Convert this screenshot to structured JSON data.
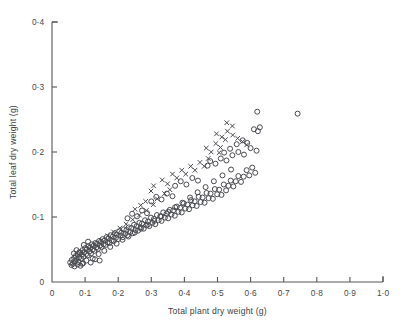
{
  "chart_data": {
    "type": "scatter",
    "title": "",
    "xlabel": "Total plant dry weight (g)",
    "ylabel": "Total leaf dry weight (g)",
    "xlim": [
      0,
      1.0
    ],
    "ylim": [
      0,
      0.4
    ],
    "grid": false,
    "legend": "none",
    "xticks": [
      0,
      0.1,
      0.2,
      0.3,
      0.4,
      0.5,
      0.6,
      0.7,
      0.8,
      0.9,
      1.0
    ],
    "xticklabels": [
      "0",
      "0·1",
      "0·2",
      "0·3",
      "0·4",
      "0·5",
      "0·6",
      "0·7",
      "0·8",
      "0·9",
      "1·0"
    ],
    "yticks": [
      0,
      0.1,
      0.2,
      0.3,
      0.4
    ],
    "yticklabels": [
      "0",
      "0·1",
      "0·2",
      "0·3",
      "0·4"
    ],
    "marker_color": "#4a4b50",
    "series": [
      {
        "name": "open-circle",
        "marker": "circle",
        "points": [
          [
            0.055,
            0.03
          ],
          [
            0.06,
            0.034
          ],
          [
            0.063,
            0.028
          ],
          [
            0.067,
            0.037
          ],
          [
            0.07,
            0.032
          ],
          [
            0.072,
            0.04
          ],
          [
            0.075,
            0.035
          ],
          [
            0.078,
            0.043
          ],
          [
            0.08,
            0.031
          ],
          [
            0.082,
            0.038
          ],
          [
            0.085,
            0.045
          ],
          [
            0.088,
            0.036
          ],
          [
            0.09,
            0.042
          ],
          [
            0.092,
            0.049
          ],
          [
            0.095,
            0.039
          ],
          [
            0.098,
            0.046
          ],
          [
            0.1,
            0.052
          ],
          [
            0.103,
            0.043
          ],
          [
            0.105,
            0.05
          ],
          [
            0.108,
            0.041
          ],
          [
            0.11,
            0.055
          ],
          [
            0.113,
            0.047
          ],
          [
            0.115,
            0.053
          ],
          [
            0.118,
            0.044
          ],
          [
            0.12,
            0.058
          ],
          [
            0.123,
            0.05
          ],
          [
            0.126,
            0.056
          ],
          [
            0.128,
            0.048
          ],
          [
            0.131,
            0.06
          ],
          [
            0.134,
            0.053
          ],
          [
            0.136,
            0.059
          ],
          [
            0.139,
            0.051
          ],
          [
            0.142,
            0.063
          ],
          [
            0.145,
            0.056
          ],
          [
            0.148,
            0.062
          ],
          [
            0.15,
            0.054
          ],
          [
            0.153,
            0.066
          ],
          [
            0.156,
            0.058
          ],
          [
            0.159,
            0.064
          ],
          [
            0.162,
            0.057
          ],
          [
            0.165,
            0.069
          ],
          [
            0.168,
            0.061
          ],
          [
            0.171,
            0.067
          ],
          [
            0.174,
            0.06
          ],
          [
            0.177,
            0.072
          ],
          [
            0.18,
            0.064
          ],
          [
            0.184,
            0.07
          ],
          [
            0.187,
            0.063
          ],
          [
            0.19,
            0.075
          ],
          [
            0.193,
            0.068
          ],
          [
            0.196,
            0.073
          ],
          [
            0.2,
            0.066
          ],
          [
            0.203,
            0.078
          ],
          [
            0.207,
            0.071
          ],
          [
            0.21,
            0.076
          ],
          [
            0.214,
            0.069
          ],
          [
            0.217,
            0.081
          ],
          [
            0.221,
            0.074
          ],
          [
            0.225,
            0.08
          ],
          [
            0.228,
            0.072
          ],
          [
            0.232,
            0.084
          ],
          [
            0.236,
            0.077
          ],
          [
            0.24,
            0.083
          ],
          [
            0.244,
            0.075
          ],
          [
            0.248,
            0.088
          ],
          [
            0.252,
            0.08
          ],
          [
            0.256,
            0.086
          ],
          [
            0.26,
            0.079
          ],
          [
            0.264,
            0.091
          ],
          [
            0.268,
            0.084
          ],
          [
            0.272,
            0.09
          ],
          [
            0.277,
            0.082
          ],
          [
            0.281,
            0.095
          ],
          [
            0.285,
            0.087
          ],
          [
            0.29,
            0.093
          ],
          [
            0.294,
            0.086
          ],
          [
            0.299,
            0.099
          ],
          [
            0.303,
            0.091
          ],
          [
            0.308,
            0.097
          ],
          [
            0.312,
            0.089
          ],
          [
            0.317,
            0.103
          ],
          [
            0.322,
            0.095
          ],
          [
            0.327,
            0.101
          ],
          [
            0.331,
            0.094
          ],
          [
            0.336,
            0.107
          ],
          [
            0.341,
            0.099
          ],
          [
            0.346,
            0.105
          ],
          [
            0.351,
            0.098
          ],
          [
            0.356,
            0.111
          ],
          [
            0.361,
            0.104
          ],
          [
            0.366,
            0.11
          ],
          [
            0.371,
            0.102
          ],
          [
            0.377,
            0.116
          ],
          [
            0.382,
            0.108
          ],
          [
            0.387,
            0.114
          ],
          [
            0.392,
            0.107
          ],
          [
            0.398,
            0.121
          ],
          [
            0.403,
            0.113
          ],
          [
            0.409,
            0.119
          ],
          [
            0.414,
            0.112
          ],
          [
            0.42,
            0.126
          ],
          [
            0.425,
            0.118
          ],
          [
            0.431,
            0.124
          ],
          [
            0.437,
            0.117
          ],
          [
            0.443,
            0.131
          ],
          [
            0.449,
            0.123
          ],
          [
            0.455,
            0.13
          ],
          [
            0.461,
            0.122
          ],
          [
            0.467,
            0.137
          ],
          [
            0.473,
            0.129
          ],
          [
            0.479,
            0.136
          ],
          [
            0.486,
            0.128
          ],
          [
            0.492,
            0.143
          ],
          [
            0.499,
            0.135
          ],
          [
            0.505,
            0.142
          ],
          [
            0.512,
            0.134
          ],
          [
            0.519,
            0.15
          ],
          [
            0.526,
            0.141
          ],
          [
            0.533,
            0.148
          ],
          [
            0.54,
            0.156
          ],
          [
            0.548,
            0.147
          ],
          [
            0.555,
            0.155
          ],
          [
            0.563,
            0.163
          ],
          [
            0.571,
            0.154
          ],
          [
            0.579,
            0.162
          ],
          [
            0.588,
            0.172
          ],
          [
            0.596,
            0.164
          ],
          [
            0.605,
            0.176
          ],
          [
            0.614,
            0.168
          ],
          [
            0.123,
            0.036
          ],
          [
            0.141,
            0.043
          ],
          [
            0.158,
            0.048
          ],
          [
            0.176,
            0.054
          ],
          [
            0.195,
            0.059
          ],
          [
            0.213,
            0.065
          ],
          [
            0.231,
            0.07
          ],
          [
            0.25,
            0.076
          ],
          [
            0.269,
            0.082
          ],
          [
            0.289,
            0.088
          ],
          [
            0.309,
            0.094
          ],
          [
            0.33,
            0.101
          ],
          [
            0.351,
            0.108
          ],
          [
            0.372,
            0.115
          ],
          [
            0.394,
            0.122
          ],
          [
            0.417,
            0.13
          ],
          [
            0.44,
            0.138
          ],
          [
            0.464,
            0.146
          ],
          [
            0.489,
            0.155
          ],
          [
            0.515,
            0.164
          ],
          [
            0.541,
            0.173
          ],
          [
            0.47,
            0.179
          ],
          [
            0.478,
            0.186
          ],
          [
            0.494,
            0.182
          ],
          [
            0.51,
            0.19
          ],
          [
            0.527,
            0.187
          ],
          [
            0.545,
            0.195
          ],
          [
            0.563,
            0.2
          ],
          [
            0.58,
            0.196
          ],
          [
            0.6,
            0.206
          ],
          [
            0.618,
            0.202
          ],
          [
            0.372,
            0.148
          ],
          [
            0.389,
            0.155
          ],
          [
            0.406,
            0.15
          ],
          [
            0.424,
            0.16
          ],
          [
            0.441,
            0.156
          ],
          [
            0.3,
            0.124
          ],
          [
            0.315,
            0.131
          ],
          [
            0.331,
            0.127
          ],
          [
            0.347,
            0.136
          ],
          [
            0.364,
            0.132
          ],
          [
            0.228,
            0.098
          ],
          [
            0.242,
            0.105
          ],
          [
            0.257,
            0.101
          ],
          [
            0.272,
            0.11
          ],
          [
            0.287,
            0.106
          ],
          [
            0.61,
            0.235
          ],
          [
            0.622,
            0.232
          ],
          [
            0.628,
            0.238
          ],
          [
            0.62,
            0.262
          ],
          [
            0.742,
            0.259
          ],
          [
            0.558,
            0.212
          ],
          [
            0.576,
            0.218
          ],
          [
            0.59,
            0.214
          ],
          [
            0.538,
            0.205
          ],
          [
            0.52,
            0.199
          ],
          [
            0.091,
            0.028
          ],
          [
            0.104,
            0.033
          ],
          [
            0.117,
            0.03
          ],
          [
            0.13,
            0.035
          ],
          [
            0.144,
            0.033
          ],
          [
            0.066,
            0.044
          ],
          [
            0.074,
            0.049
          ],
          [
            0.083,
            0.046
          ],
          [
            0.096,
            0.057
          ],
          [
            0.109,
            0.062
          ],
          [
            0.059,
            0.026
          ],
          [
            0.068,
            0.024
          ],
          [
            0.077,
            0.027
          ],
          [
            0.086,
            0.025
          ],
          [
            0.094,
            0.029
          ]
        ]
      },
      {
        "name": "cross",
        "marker": "x",
        "points": [
          [
            0.113,
            0.052
          ],
          [
            0.128,
            0.057
          ],
          [
            0.149,
            0.064
          ],
          [
            0.168,
            0.071
          ],
          [
            0.186,
            0.077
          ],
          [
            0.205,
            0.083
          ],
          [
            0.224,
            0.089
          ],
          [
            0.244,
            0.096
          ],
          [
            0.264,
            0.103
          ],
          [
            0.285,
            0.11
          ],
          [
            0.299,
            0.14
          ],
          [
            0.307,
            0.148
          ],
          [
            0.318,
            0.128
          ],
          [
            0.333,
            0.157
          ],
          [
            0.349,
            0.151
          ],
          [
            0.364,
            0.166
          ],
          [
            0.377,
            0.16
          ],
          [
            0.392,
            0.172
          ],
          [
            0.404,
            0.166
          ],
          [
            0.419,
            0.178
          ],
          [
            0.432,
            0.172
          ],
          [
            0.447,
            0.184
          ],
          [
            0.46,
            0.178
          ],
          [
            0.472,
            0.19
          ],
          [
            0.306,
            0.119
          ],
          [
            0.466,
            0.206
          ],
          [
            0.481,
            0.2
          ],
          [
            0.495,
            0.213
          ],
          [
            0.509,
            0.207
          ],
          [
            0.524,
            0.219
          ],
          [
            0.497,
            0.228
          ],
          [
            0.513,
            0.223
          ],
          [
            0.53,
            0.232
          ],
          [
            0.546,
            0.226
          ],
          [
            0.561,
            0.221
          ],
          [
            0.576,
            0.216
          ],
          [
            0.588,
            0.211
          ],
          [
            0.545,
            0.24
          ],
          [
            0.528,
            0.245
          ],
          [
            0.505,
            0.199
          ],
          [
            0.251,
            0.112
          ],
          [
            0.268,
            0.118
          ],
          [
            0.283,
            0.124
          ],
          [
            0.34,
            0.136
          ],
          [
            0.356,
            0.142
          ]
        ]
      }
    ]
  },
  "axes": {
    "x_axis_name": "x-axis",
    "y_axis_name": "y-axis"
  }
}
